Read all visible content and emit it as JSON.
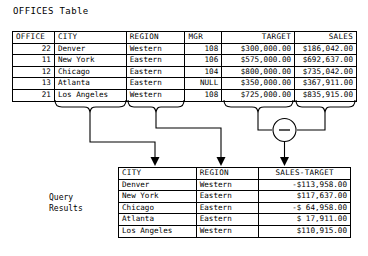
{
  "title": "OFFICES Table",
  "offices_table": {
    "name": "offices-table",
    "columns": [
      {
        "key": "office",
        "label": "OFFICE"
      },
      {
        "key": "city",
        "label": "CITY"
      },
      {
        "key": "region",
        "label": "REGION"
      },
      {
        "key": "mgr",
        "label": "MGR"
      },
      {
        "key": "target",
        "label": "TARGET"
      },
      {
        "key": "sales",
        "label": "SALES"
      }
    ],
    "rows": [
      {
        "office": "22",
        "city": "Denver",
        "region": "Western",
        "mgr": "108",
        "target": "$300,000.00",
        "sales": "$186,042.00"
      },
      {
        "office": "11",
        "city": "New York",
        "region": "Eastern",
        "mgr": "106",
        "target": "$575,000.00",
        "sales": "$692,637.00"
      },
      {
        "office": "12",
        "city": "Chicago",
        "region": "Eastern",
        "mgr": "104",
        "target": "$800,000.00",
        "sales": "$735,042.00"
      },
      {
        "office": "13",
        "city": "Atlanta",
        "region": "Eastern",
        "mgr": "NULL",
        "target": "$350,000.00",
        "sales": "$367,911.00"
      },
      {
        "office": "21",
        "city": "Los Angeles",
        "region": "Western",
        "mgr": "108",
        "target": "$725,000.00",
        "sales": "$835,915.00"
      }
    ]
  },
  "query_results_label": "Query\nResults",
  "results_table": {
    "name": "results-table",
    "columns": [
      {
        "key": "city",
        "label": "CITY"
      },
      {
        "key": "region",
        "label": "REGION"
      },
      {
        "key": "diff",
        "label": "SALES-TARGET"
      }
    ],
    "rows": [
      {
        "city": "Denver",
        "region": "Western",
        "diff": "-$113,958.00"
      },
      {
        "city": "New York",
        "region": "Eastern",
        "diff": " $117,637.00"
      },
      {
        "city": "Chicago",
        "region": "Eastern",
        "diff": "-$ 64,958.00"
      },
      {
        "city": "Atlanta",
        "region": "Eastern",
        "diff": " $ 17,911.00"
      },
      {
        "city": "Los Angeles",
        "region": "Western",
        "diff": " $110,915.00"
      }
    ]
  },
  "diagram": {
    "operator_symbol": "−",
    "operator_name": "subtraction-operator",
    "braces": [
      {
        "name": "brace-city",
        "source_column": "CITY"
      },
      {
        "name": "brace-region",
        "source_column": "REGION"
      },
      {
        "name": "brace-target",
        "source_column": "TARGET"
      },
      {
        "name": "brace-sales",
        "source_column": "SALES"
      }
    ],
    "arrows": [
      {
        "name": "arrow-to-city",
        "target_column": "CITY"
      },
      {
        "name": "arrow-to-region",
        "target_column": "REGION"
      },
      {
        "name": "arrow-to-diff",
        "target_column": "SALES-TARGET"
      }
    ]
  },
  "colors": {
    "ink": "#000000",
    "paper": "#ffffff"
  }
}
